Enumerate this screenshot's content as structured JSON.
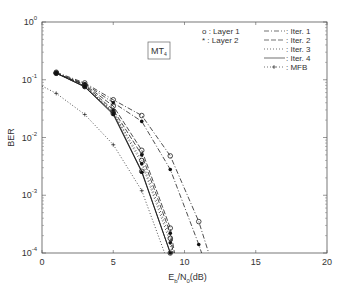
{
  "chart_data": {
    "type": "line",
    "title": "",
    "annotation": "MT4",
    "xlabel": "Eb/N0(dB)",
    "ylabel": "BER",
    "xlim": [
      0,
      20
    ],
    "ylim": [
      0.0001,
      1
    ],
    "yscale": "log",
    "xticks": [
      "0",
      "5",
      "10",
      "15",
      "20"
    ],
    "yticks": [
      "10^0",
      "10^-1",
      "10^-2",
      "10^-3",
      "10^-4"
    ],
    "grid": false,
    "legend_markers": [
      {
        "symbol": "o",
        "label": "Layer 1"
      },
      {
        "symbol": "*",
        "label": "Layer 2"
      }
    ],
    "legend_lines": [
      {
        "style": "dash-dot",
        "label": "Iter. 1"
      },
      {
        "style": "dashed",
        "label": "Iter. 2"
      },
      {
        "style": "dotted",
        "label": "Iter. 3"
      },
      {
        "style": "solid",
        "label": "Iter. 4"
      },
      {
        "style": "dotted-plus",
        "label": "MFB"
      }
    ],
    "series": [
      {
        "name": "Iter. 1 Layer 1",
        "style": "dash-dot",
        "marker": "o",
        "x": [
          1,
          3,
          5,
          7,
          9,
          11,
          11.7
        ],
        "y": [
          0.135,
          0.088,
          0.045,
          0.024,
          0.0048,
          0.00035,
          0.0001
        ]
      },
      {
        "name": "Iter. 1 Layer 2",
        "style": "dash-dot",
        "marker": "*",
        "x": [
          1,
          3,
          5,
          7,
          9,
          11,
          11.2
        ],
        "y": [
          0.13,
          0.085,
          0.04,
          0.019,
          0.0028,
          0.00014,
          0.0001
        ]
      },
      {
        "name": "Iter. 2 Layer 1",
        "style": "dashed",
        "marker": "o",
        "x": [
          1,
          3,
          5,
          7,
          9,
          9.3
        ],
        "y": [
          0.13,
          0.082,
          0.035,
          0.006,
          0.00027,
          0.0001
        ]
      },
      {
        "name": "Iter. 2 Layer 2",
        "style": "dashed",
        "marker": "*",
        "x": [
          1,
          3,
          5,
          7,
          9,
          9.2
        ],
        "y": [
          0.13,
          0.08,
          0.03,
          0.005,
          0.00022,
          0.0001
        ]
      },
      {
        "name": "Iter. 3 Layer 1",
        "style": "dotted",
        "marker": "o",
        "x": [
          1,
          3,
          5,
          7,
          9,
          9.2
        ],
        "y": [
          0.13,
          0.078,
          0.028,
          0.004,
          0.00018,
          0.0001
        ]
      },
      {
        "name": "Iter. 3 Layer 2",
        "style": "dotted",
        "marker": "*",
        "x": [
          1,
          3,
          5,
          7,
          9,
          9.1
        ],
        "y": [
          0.13,
          0.077,
          0.027,
          0.0035,
          0.00015,
          0.0001
        ]
      },
      {
        "name": "Iter. 4 Layer 1",
        "style": "solid",
        "marker": "o",
        "x": [
          1,
          3,
          5,
          7,
          9
        ],
        "y": [
          0.13,
          0.076,
          0.026,
          0.0026,
          0.0001
        ]
      },
      {
        "name": "Iter. 4 Layer 2",
        "style": "solid",
        "marker": "*",
        "x": [
          1,
          3,
          5,
          7,
          9
        ],
        "y": [
          0.13,
          0.075,
          0.025,
          0.0025,
          0.0001
        ]
      },
      {
        "name": "MFB",
        "style": "dotted",
        "marker": "+",
        "x": [
          0,
          1,
          3,
          5,
          7,
          8.6
        ],
        "y": [
          0.078,
          0.058,
          0.025,
          0.0075,
          0.0012,
          0.0001
        ]
      }
    ]
  }
}
